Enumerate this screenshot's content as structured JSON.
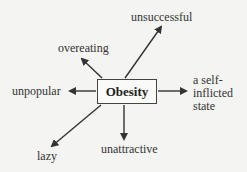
{
  "diagram": {
    "center": "Obesity",
    "associations": [
      {
        "id": "unsuccessful",
        "label": "unsuccessful"
      },
      {
        "id": "overeating",
        "label": "overeating"
      },
      {
        "id": "unpopular",
        "label": "unpopular"
      },
      {
        "id": "self-inflicted",
        "label_lines": [
          "a self-",
          "inflicted",
          "state"
        ]
      },
      {
        "id": "lazy",
        "label": "lazy"
      },
      {
        "id": "unattractive",
        "label": "unattractive"
      }
    ]
  },
  "colors": {
    "line": "#3a3a3a",
    "background": "#f4f4f2",
    "box_border": "#444444"
  }
}
